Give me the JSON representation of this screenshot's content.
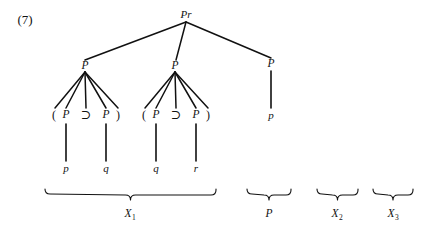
{
  "figure": {
    "item_number": "(7)",
    "width": 426,
    "height": 232,
    "ink_color": "#111111",
    "background_color": "#ffffff"
  },
  "tree": {
    "root": {
      "label": "Pr",
      "x": 186,
      "y": 14
    },
    "level1": [
      {
        "label": "P",
        "x": 85,
        "y": 66
      },
      {
        "label": "P",
        "x": 175,
        "y": 66
      },
      {
        "label": "P",
        "x": 271,
        "y": 64
      }
    ],
    "left_expansion": {
      "tokens": [
        {
          "text": "(",
          "x": 54,
          "y": 115
        },
        {
          "text": "P",
          "x": 66,
          "y": 115
        },
        {
          "text": "⊃",
          "x": 86,
          "y": 115
        },
        {
          "text": "P",
          "x": 106,
          "y": 115
        },
        {
          "text": ")",
          "x": 118,
          "y": 115
        }
      ]
    },
    "middle_expansion": {
      "tokens": [
        {
          "text": "(",
          "x": 144,
          "y": 115
        },
        {
          "text": "P",
          "x": 156,
          "y": 115
        },
        {
          "text": "⊃",
          "x": 176,
          "y": 115
        },
        {
          "text": "P",
          "x": 196,
          "y": 115
        },
        {
          "text": ")",
          "x": 208,
          "y": 115
        }
      ]
    },
    "terminals": [
      {
        "label": "p",
        "x": 66,
        "y": 168
      },
      {
        "label": "q",
        "x": 106,
        "y": 168
      },
      {
        "label": "q",
        "x": 156,
        "y": 168
      },
      {
        "label": "r",
        "x": 196,
        "y": 168
      },
      {
        "label": "p",
        "x": 271,
        "y": 115
      }
    ]
  },
  "braces": [
    {
      "label": "X",
      "subscript": "1",
      "x_start": 45,
      "x_end": 216,
      "y": 190,
      "label_x": 130,
      "label_y": 214
    },
    {
      "label": "P",
      "subscript": "",
      "x_start": 247,
      "x_end": 291,
      "y": 190,
      "label_x": 269,
      "label_y": 214
    },
    {
      "label": "X",
      "subscript": "2",
      "x_start": 317,
      "x_end": 358,
      "y": 190,
      "label_x": 337,
      "label_y": 214
    },
    {
      "label": "X",
      "subscript": "3",
      "x_start": 373,
      "x_end": 413,
      "y": 190,
      "label_x": 393,
      "label_y": 214
    }
  ],
  "edges": {
    "root_to_children": [
      {
        "from": [
          186,
          22
        ],
        "to": [
          85,
          60
        ]
      },
      {
        "from": [
          186,
          22
        ],
        "to": [
          176,
          60
        ]
      },
      {
        "from": [
          186,
          22
        ],
        "to": [
          271,
          58
        ]
      }
    ],
    "left_fan": [
      {
        "from": [
          85,
          72
        ],
        "to": [
          55,
          108
        ]
      },
      {
        "from": [
          85,
          72
        ],
        "to": [
          66,
          108
        ]
      },
      {
        "from": [
          85,
          72
        ],
        "to": [
          86,
          108
        ]
      },
      {
        "from": [
          85,
          72
        ],
        "to": [
          106,
          108
        ]
      },
      {
        "from": [
          85,
          72
        ],
        "to": [
          118,
          108
        ]
      }
    ],
    "middle_fan": [
      {
        "from": [
          175,
          72
        ],
        "to": [
          145,
          108
        ]
      },
      {
        "from": [
          175,
          72
        ],
        "to": [
          156,
          108
        ]
      },
      {
        "from": [
          175,
          72
        ],
        "to": [
          176,
          108
        ]
      },
      {
        "from": [
          175,
          72
        ],
        "to": [
          196,
          108
        ]
      },
      {
        "from": [
          175,
          72
        ],
        "to": [
          208,
          108
        ]
      }
    ],
    "terminal_stems": [
      {
        "from": [
          66,
          124
        ],
        "to": [
          66,
          161
        ]
      },
      {
        "from": [
          106,
          124
        ],
        "to": [
          106,
          161
        ]
      },
      {
        "from": [
          156,
          124
        ],
        "to": [
          156,
          161
        ]
      },
      {
        "from": [
          196,
          124
        ],
        "to": [
          196,
          161
        ]
      },
      {
        "from": [
          271,
          71
        ],
        "to": [
          271,
          108
        ]
      }
    ]
  }
}
